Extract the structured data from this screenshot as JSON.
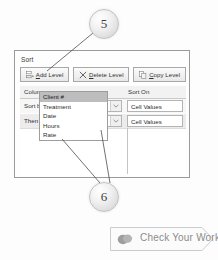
{
  "dialog": {
    "title": "Sort",
    "toolbar": {
      "add_level": "Add Level",
      "delete_level": "Delete Level",
      "copy_level": "Copy Level",
      "add_level_icon": "insert-row-icon",
      "delete_level_icon": "x-mark-icon",
      "copy_level_icon": "copy-icon"
    },
    "headers": {
      "column": "Column",
      "sort_on": "Sort On"
    },
    "rows": [
      {
        "label": "Sort by",
        "column_value": "Date",
        "sort_on_value": "Cell Values"
      },
      {
        "label": "Then by",
        "column_value": "",
        "sort_on_value": "Cell Values"
      }
    ],
    "dropdown": {
      "open": true,
      "selected": "Client #",
      "items": [
        "Client #",
        "Treatment",
        "Date",
        "Hours",
        "Rate"
      ]
    }
  },
  "callouts": [
    {
      "number": "5"
    },
    {
      "number": "6"
    }
  ],
  "banner": {
    "label": "Check Your Work",
    "icon": "coins-icon"
  },
  "colors": {
    "dialog_border": "#9a9a9a",
    "button_face": "#f1f1f1",
    "header_strip": "#f2f2f2",
    "row_alt": "#ececec",
    "dropdown_selected": "#bdbdbd",
    "banner_text": "#8c8c8c",
    "callout_text": "#3f3f3f"
  }
}
